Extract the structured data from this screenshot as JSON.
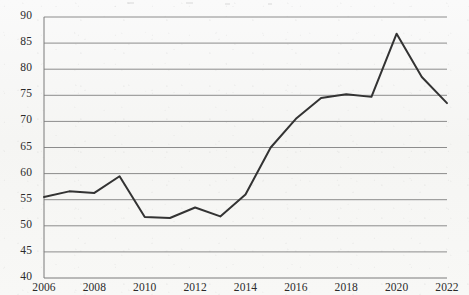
{
  "figure": {
    "background_color": "#f7f7f5",
    "line_color": "#333333",
    "grid_color": "#8c8c8c",
    "axis_color": "#7a7a7a",
    "text_color": "#2b2b2b"
  },
  "chart_data": {
    "type": "line",
    "title": "",
    "subtitle": "",
    "xlabel": "",
    "ylabel": "",
    "xlim": [
      2006,
      2022
    ],
    "ylim": [
      40,
      90
    ],
    "ytick_step": 5,
    "xtick_step": 2,
    "grid": true,
    "grid_axis": "y",
    "legend": false,
    "legend_position": "none",
    "markers": false,
    "yticks": [
      40,
      45,
      50,
      55,
      60,
      65,
      70,
      75,
      80,
      85,
      90
    ],
    "ytick_labels": [
      "40",
      "45",
      "50",
      "55",
      "60",
      "65",
      "70",
      "75",
      "80",
      "85",
      "90"
    ],
    "xticks": [
      2006,
      2008,
      2010,
      2012,
      2014,
      2016,
      2018,
      2020,
      2022
    ],
    "xtick_labels": [
      "2006",
      "2008",
      "2010",
      "2012",
      "2014",
      "2016",
      "2018",
      "2020",
      "2022"
    ],
    "x": [
      2006,
      2007,
      2008,
      2009,
      2010,
      2011,
      2012,
      2013,
      2014,
      2015,
      2016,
      2017,
      2018,
      2019,
      2020,
      2021,
      2022
    ],
    "values": [
      55.5,
      56.6,
      56.3,
      59.5,
      51.7,
      51.5,
      53.5,
      51.8,
      56.0,
      65.0,
      70.5,
      74.5,
      75.2,
      74.7,
      86.8,
      78.5,
      73.5
    ],
    "series": [
      {
        "name": "",
        "values": [
          55.5,
          56.6,
          56.3,
          59.5,
          51.7,
          51.5,
          53.5,
          51.8,
          56.0,
          65.0,
          70.5,
          74.5,
          75.2,
          74.7,
          86.8,
          78.5,
          73.5
        ]
      }
    ]
  }
}
